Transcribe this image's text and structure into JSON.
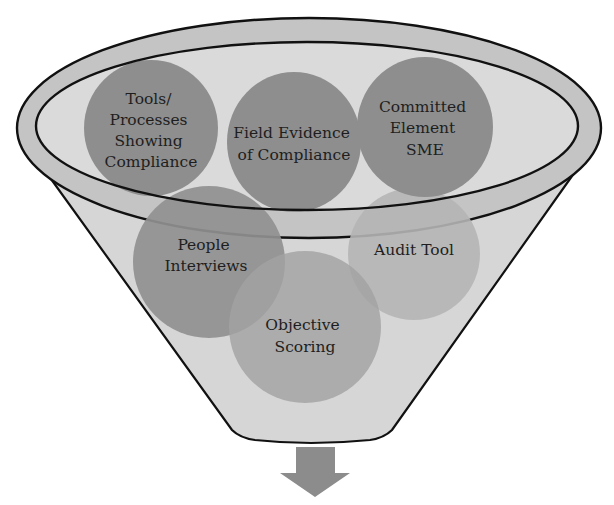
{
  "diagram": {
    "type": "funnel",
    "colors": {
      "funnel_fill": "#d6d6d6",
      "rim_band": "#bcbcbc",
      "outline": "#111111",
      "circle_dark": "#8f8f8f",
      "circle_mid": "#999999",
      "circle_light": "#b3b3b3",
      "arrow": "#8c8c8c"
    },
    "top_circles": [
      {
        "id": "tools",
        "lines": [
          "Tools/",
          "Processes",
          "Showing",
          "Compliance"
        ]
      },
      {
        "id": "field",
        "lines": [
          "Field Evidence",
          "of Compliance"
        ]
      },
      {
        "id": "committed",
        "lines": [
          "Committed",
          "Element",
          "SME"
        ]
      }
    ],
    "lower_circles": [
      {
        "id": "people",
        "lines": [
          "People",
          "Interviews"
        ]
      },
      {
        "id": "audit",
        "lines": [
          "Audit Tool"
        ]
      },
      {
        "id": "objective",
        "lines": [
          "Objective",
          "Scoring"
        ]
      }
    ],
    "output_arrow": "down-arrow-icon"
  }
}
